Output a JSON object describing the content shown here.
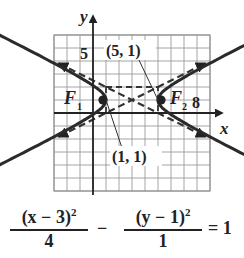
{
  "figure": {
    "equation": {
      "term1_numerator": "(x − 3)",
      "term1_exponent": "2",
      "term1_denominator": "4",
      "minus": "−",
      "term2_numerator": "(y − 1)",
      "term2_exponent": "2",
      "term2_denominator": "1",
      "equals": "= 1"
    },
    "labels": {
      "x_axis": "x",
      "y_axis": "y",
      "y_tick": "5",
      "x_tick": "8",
      "focus1": "F",
      "focus1_sub": "1",
      "focus2": "F",
      "focus2_sub": "2",
      "vertex_right": "(5, 1)",
      "vertex_left": "(1, 1)"
    }
  },
  "chart_data": {
    "type": "line",
    "title": "",
    "xlabel": "x",
    "ylabel": "y",
    "xlim": [
      -3,
      9
    ],
    "ylim": [
      -6,
      6
    ],
    "grid": true,
    "curve": "hyperbola",
    "center": [
      3,
      1
    ],
    "a": 2,
    "b": 1,
    "vertices": [
      [
        1,
        1
      ],
      [
        5,
        1
      ]
    ],
    "foci": [
      [
        0.76,
        1
      ],
      [
        5.24,
        1
      ]
    ],
    "asymptotes": [
      {
        "slope": 0.5,
        "through": [
          3,
          1
        ]
      },
      {
        "slope": -0.5,
        "through": [
          3,
          1
        ]
      }
    ],
    "central_rectangle": {
      "x": [
        1,
        5
      ],
      "y": [
        0,
        2
      ]
    },
    "tick_labels": {
      "x": [
        8
      ],
      "y": [
        5
      ]
    },
    "annotations": [
      "(5, 1)",
      "(1, 1)",
      "F1",
      "F2"
    ]
  }
}
